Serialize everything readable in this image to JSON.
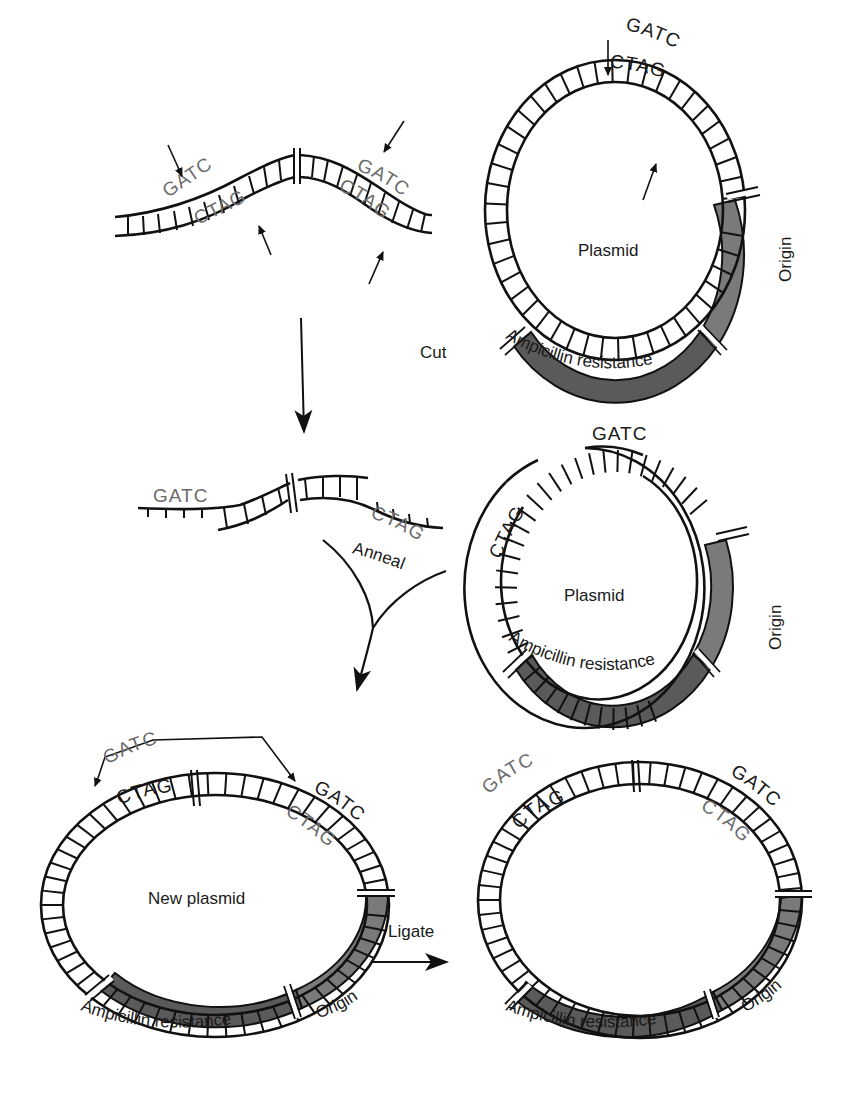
{
  "figure": {
    "type": "cloning-diagram",
    "colors": {
      "line": "#111111",
      "ampicillin_fill": "#5a5a5a",
      "origin_fill": "#7a7a7a",
      "gray_sequence_text": "#6b6b6b",
      "background": "#ffffff"
    }
  },
  "step1": {
    "insert_fragment": {
      "site_left_top": "GATC",
      "site_left_bottom": "CTAG",
      "site_right_top": "GATC",
      "site_right_bottom": "CTAG"
    },
    "plasmid": {
      "label": "Plasmid",
      "site_top": "GATC",
      "site_bottom": "CTAG",
      "origin_label": "Origin",
      "ampicillin_label": "Ampicillin resistance"
    },
    "cut_label": "Cut"
  },
  "step2": {
    "insert_fragment": {
      "overhang_left": "GATC",
      "overhang_right": "CTAG"
    },
    "anneal_label": "Anneal",
    "plasmid": {
      "label": "Plasmid",
      "overhang_top": "GATC",
      "overhang_left": "CTAG",
      "origin_label": "Origin",
      "ampicillin_label": "Ampicillin resistance"
    }
  },
  "step3": {
    "new_plasmid": {
      "label": "New plasmid",
      "site_left_top": "GATC",
      "site_left_bottom": "CTAG",
      "site_right_top": "GATC",
      "site_right_bottom": "CTAG",
      "origin_label": "Origin",
      "ampicillin_label": "Ampicillin resistance"
    },
    "ligate_label": "Ligate",
    "final_plasmid": {
      "site_left_top": "GATC",
      "site_left_bottom": "CTAG",
      "site_right_top": "GATC",
      "site_right_bottom": "CTAG",
      "origin_label": "Origin",
      "ampicillin_label": "Ampicillin resistance"
    }
  }
}
